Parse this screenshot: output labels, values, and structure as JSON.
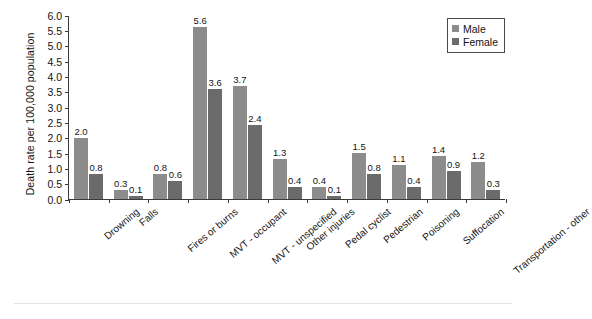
{
  "chart_data": {
    "type": "bar",
    "title": "",
    "subtitle": "",
    "xlabel": "",
    "ylabel": "Death rate per 100,000 population",
    "ylim": [
      0.0,
      6.0
    ],
    "ytick_step": 0.5,
    "ytick_labels": [
      "0.0",
      "0.5",
      "1.0",
      "1.5",
      "2.0",
      "2.5",
      "3.0",
      "3.5",
      "4.0",
      "4.5",
      "5.0",
      "5.5",
      "6.0"
    ],
    "grid": false,
    "legend_position": "top-right",
    "value_labels": true,
    "categories": [
      "Drowning",
      "Falls",
      "Fires or burns",
      "MVT - occupant",
      "MVT - unspecified",
      "Other injuries",
      "Pedal cyclist",
      "Pedestrian",
      "Poisoning",
      "Suffocation",
      "Transportation - other"
    ],
    "series": [
      {
        "name": "Male",
        "color": "#8c8c8c",
        "values": [
          2.0,
          0.3,
          0.8,
          5.6,
          3.7,
          1.3,
          0.4,
          1.5,
          1.1,
          1.4,
          1.2
        ]
      },
      {
        "name": "Female",
        "color": "#6b6b6b",
        "values": [
          0.8,
          0.1,
          0.6,
          3.6,
          2.4,
          0.4,
          0.1,
          0.8,
          0.4,
          0.9,
          0.3
        ]
      }
    ]
  },
  "legend": {
    "items": [
      {
        "label": "Male"
      },
      {
        "label": "Female"
      }
    ]
  },
  "colors": {
    "male": "#8c8c8c",
    "female": "#6b6b6b",
    "axis": "#3a3a3a",
    "text": "#141414",
    "background": "#ffffff"
  }
}
